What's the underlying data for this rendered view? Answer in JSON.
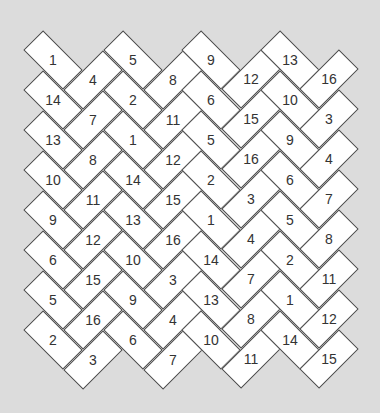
{
  "puzzle": {
    "colors": {
      "background": "#dcdcdc",
      "tile_fill": "#ffffff",
      "tile_border": "#4a4a4a",
      "text": "#333333"
    },
    "columns": [
      {
        "orientation": "down",
        "x": 53,
        "y_start": 60,
        "numbers": [
          "1",
          "14",
          "13",
          "10",
          "9",
          "6",
          "5",
          "2"
        ]
      },
      {
        "orientation": "up",
        "x": 93,
        "y_start": 80,
        "numbers": [
          "4",
          "7",
          "8",
          "11",
          "12",
          "15",
          "16",
          "3"
        ]
      },
      {
        "orientation": "down",
        "x": 133,
        "y_start": 60,
        "numbers": [
          "5",
          "2",
          "1",
          "14",
          "13",
          "10",
          "9",
          "6"
        ]
      },
      {
        "orientation": "up",
        "x": 173,
        "y_start": 80,
        "numbers": [
          "8",
          "11",
          "12",
          "15",
          "16",
          "3",
          "4",
          "7"
        ]
      },
      {
        "orientation": "down",
        "x": 211,
        "y_start": 60,
        "numbers": [
          "9",
          "6",
          "5",
          "2",
          "1",
          "14",
          "13",
          "10"
        ]
      },
      {
        "orientation": "up",
        "x": 251,
        "y_start": 79,
        "numbers": [
          "12",
          "15",
          "16",
          "3",
          "4",
          "7",
          "8",
          "11"
        ]
      },
      {
        "orientation": "down",
        "x": 290,
        "y_start": 60,
        "numbers": [
          "13",
          "10",
          "9",
          "6",
          "5",
          "2",
          "1",
          "14"
        ]
      },
      {
        "orientation": "up",
        "x": 329,
        "y_start": 79,
        "numbers": [
          "16",
          "3",
          "4",
          "7",
          "8",
          "11",
          "12",
          "15"
        ]
      }
    ]
  }
}
